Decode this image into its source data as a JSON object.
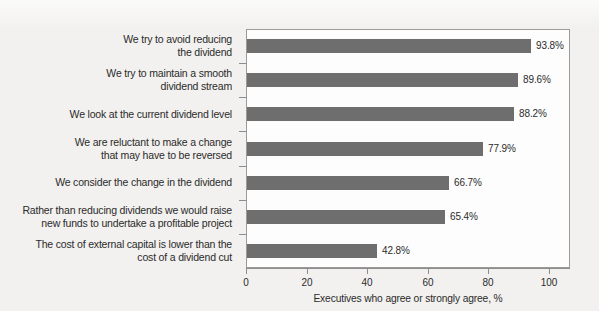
{
  "chart_data": {
    "type": "bar",
    "orientation": "horizontal",
    "title": "",
    "xlabel": "Executives who agree or strongly agree, %",
    "ylabel": "",
    "xlim": [
      0,
      100
    ],
    "xticks": [
      "0",
      "20",
      "40",
      "60",
      "80",
      "100"
    ],
    "grid": false,
    "legend": "none",
    "bar_color": "#6e6e6e",
    "categories": [
      "We try to avoid reducing\nthe dividend",
      "We try to maintain a smooth\ndividend stream",
      "We look at the current dividend level",
      "We are reluctant to make a change\nthat may have to be reversed",
      "We consider the change in the dividend",
      "Rather than reducing dividends we would raise\nnew funds to undertake a profitable project",
      "The cost of external capital is lower than the\ncost of a dividend cut"
    ],
    "values": [
      93.8,
      89.6,
      88.2,
      77.9,
      66.7,
      65.4,
      42.8
    ],
    "value_labels": [
      "93.8%",
      "89.6%",
      "88.2%",
      "77.9%",
      "66.7%",
      "65.4%",
      "42.8%"
    ]
  }
}
